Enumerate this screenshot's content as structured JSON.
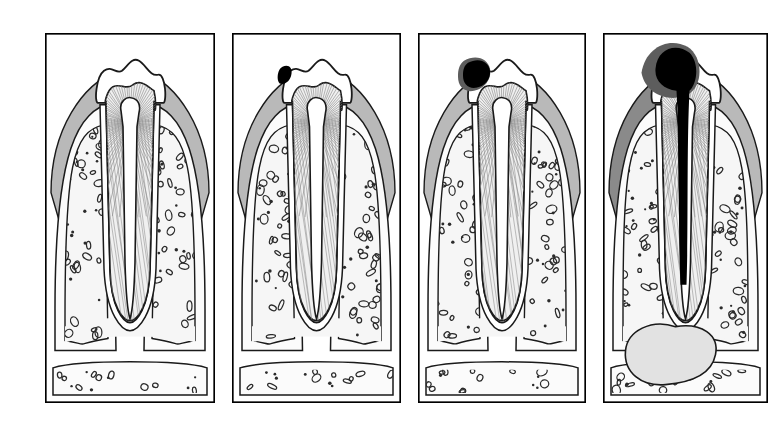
{
  "figure": {
    "type": "medical-illustration",
    "style": "black-and-white line drawing with grey tonal shading",
    "background_color": "#ffffff",
    "panel_count": 4,
    "panel_border_color": "#000000",
    "layout": "four panels in a single horizontal row, equal size, thin black rectangular frames"
  },
  "palette": {
    "background": "#ffffff",
    "outline": "#1a1a1a",
    "enamel": "#ffffff",
    "dentin": "#f0f0f0",
    "dentin_hatch": "#8d8d8d",
    "pulp": "#ffffff",
    "gingiva": "#b9b9b9",
    "gingiva_inflamed": "#8a8a8a",
    "cortical_bone": "#fbfbfb",
    "trabecular_bone": "#f6f6f6",
    "marrow_space_outline": "#2b2b2b",
    "caries_lesion": "#000000",
    "caries_halo": "#5d5d5d",
    "abscess": "#e2e2e2",
    "periodontal_ligament": "#ffffff"
  },
  "panels": [
    {
      "index": 1,
      "name": "healthy-tooth",
      "stage_label": "Healthy tooth",
      "description": "Intact tooth with sound enamel crown, dentin with radiating tubules, open pulp chamber and root canal, normal gingiva and alveolar bone",
      "lesion": {
        "present": false,
        "depth": "none",
        "size": 0
      },
      "abscess": {
        "present": false
      },
      "gingiva_state": "normal",
      "frame": {
        "x": 45,
        "y": 33,
        "width": 170,
        "height": 370
      }
    },
    {
      "index": 2,
      "name": "enamel-caries",
      "stage_label": "Enamel caries",
      "description": "Small dark carious lesion confined to the enamel on the mesial crown surface near the gingival margin; pulp unaffected",
      "lesion": {
        "present": true,
        "depth": "enamel",
        "size": 1
      },
      "abscess": {
        "present": false
      },
      "gingiva_state": "normal",
      "frame": {
        "x": 232,
        "y": 33,
        "width": 169,
        "height": 370
      }
    },
    {
      "index": 3,
      "name": "dentin-caries",
      "stage_label": "Dentin caries",
      "description": "Enlarged carious cavity that has broken through the enamel and spread laterally into the dentin, approaching but not reaching the pulp chamber",
      "lesion": {
        "present": true,
        "depth": "dentin",
        "size": 2
      },
      "abscess": {
        "present": false
      },
      "gingiva_state": "normal",
      "frame": {
        "x": 418,
        "y": 33,
        "width": 168,
        "height": 370
      }
    },
    {
      "index": 4,
      "name": "pulp-caries-with-periapical-abscess",
      "stage_label": "Pulpitis with periapical abscess",
      "description": "Extensive caries has destroyed much of the crown and invaded the pulp chamber, with infection tracking down the root canal to form a large periapical abscess in the bone at the root apex; adjacent gingiva is inflamed",
      "lesion": {
        "present": true,
        "depth": "pulp-and-root-canal",
        "size": 3
      },
      "abscess": {
        "present": true,
        "location": "periapical",
        "size": "large",
        "shape": "lobed"
      },
      "gingiva_state": "inflamed",
      "frame": {
        "x": 603,
        "y": 33,
        "width": 165,
        "height": 370
      }
    }
  ],
  "anatomy_legend": [
    {
      "key": "enamel",
      "label": "Enamel"
    },
    {
      "key": "dentin",
      "label": "Dentin"
    },
    {
      "key": "pulp",
      "label": "Pulp chamber and root canal"
    },
    {
      "key": "gingiva",
      "label": "Gingiva"
    },
    {
      "key": "cortical_bone",
      "label": "Cortical bone"
    },
    {
      "key": "trabecular_bone",
      "label": "Trabecular (cancellous) bone"
    },
    {
      "key": "periodontal_ligament",
      "label": "Periodontal ligament"
    },
    {
      "key": "caries_lesion",
      "label": "Carious lesion"
    },
    {
      "key": "abscess",
      "label": "Periapical abscess"
    }
  ]
}
